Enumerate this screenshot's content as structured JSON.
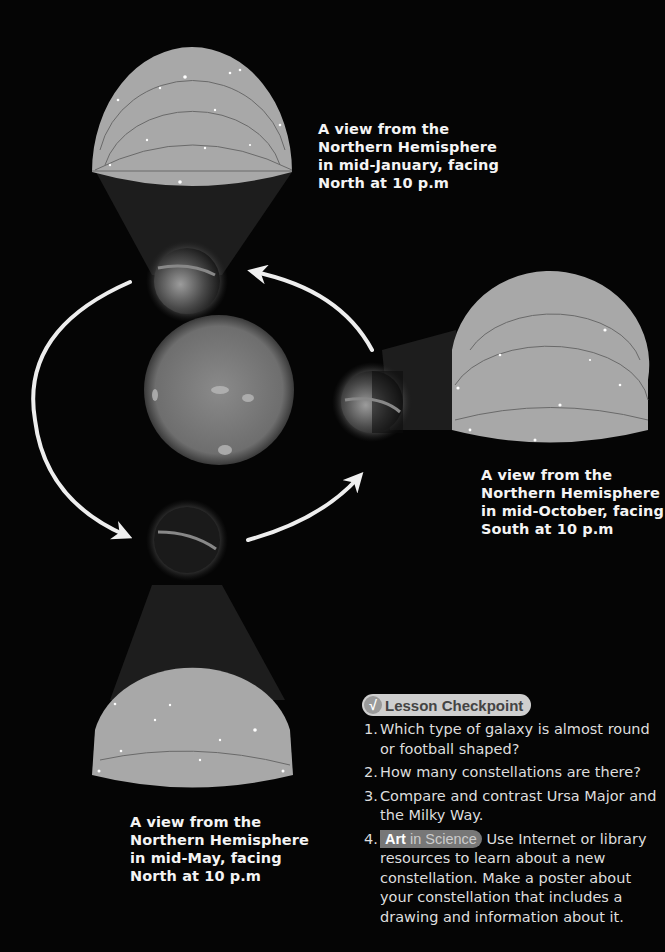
{
  "diagram": {
    "center_object": "sun",
    "orbit_direction": "counter-clockwise arrows",
    "views": [
      {
        "id": "january",
        "caption_lines": [
          "A view from the",
          "Northern Hemisphere",
          "in mid-January, facing",
          "North at 10 p.m"
        ],
        "position": "top"
      },
      {
        "id": "october",
        "caption_lines": [
          "A view from the",
          "Northern Hemisphere",
          "in mid-October, facing",
          "South at 10 p.m"
        ],
        "position": "right"
      },
      {
        "id": "may",
        "caption_lines": [
          "A view from the",
          "Northern Hemisphere",
          "in mid-May, facing",
          "North at 10 p.m"
        ],
        "position": "bottom"
      }
    ]
  },
  "checkpoint": {
    "badge_icon": "checkmark-icon",
    "badge_check": "√",
    "title": "Lesson Checkpoint",
    "questions": [
      {
        "num": "1.",
        "text": "Which type of galaxy is almost round or football shaped?"
      },
      {
        "num": "2.",
        "text": "How many constellations are there?"
      },
      {
        "num": "3.",
        "text": "Compare and contrast Ursa Major and the Milky Way."
      },
      {
        "num": "4.",
        "tag_bold": "Art",
        "tag_rest": " in Science",
        "text": " Use Internet or library resources to learn about a new constellation. Make a poster about your constellation that includes a drawing and information about it."
      }
    ]
  },
  "colors": {
    "background": "#050505",
    "sky_dome": "#a8a8a8",
    "badge": "#cfcfcf",
    "art_tag": "#777777"
  }
}
